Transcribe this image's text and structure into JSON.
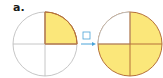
{
  "problem": {
    "label": "a.",
    "answer_box": "",
    "left_circle": {
      "parts": 4,
      "shaded_parts": 1,
      "shaded_quadrants": [
        "top-right"
      ]
    },
    "right_circle": {
      "parts": 4,
      "shaded_parts": 3,
      "shaded_quadrants": [
        "top-right",
        "bottom-right",
        "bottom-left"
      ]
    },
    "colors": {
      "fill": "#fbe77a",
      "shaded_outline": "#b5703a",
      "outline": "#b8b8b8",
      "arrow": "#4aa3d8"
    }
  }
}
